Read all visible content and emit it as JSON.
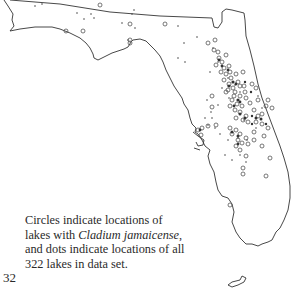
{
  "figure": {
    "caption": {
      "line1": "Circles indicate locations of",
      "line2_prefix": "lakes with ",
      "line2_species": "Cladium jamaicense",
      "line2_suffix": ",",
      "line3": "and dots indicate locations of all",
      "line4": "322 lakes in data set."
    },
    "page_number": "32",
    "total_lakes": 322,
    "species": "Cladium jamaicense",
    "legend": {
      "circle": "lake with Cladium jamaicense",
      "dot": "lake in data set"
    },
    "colors": {
      "outline": "#333333",
      "marker": "#555555",
      "background": "#ffffff"
    }
  }
}
